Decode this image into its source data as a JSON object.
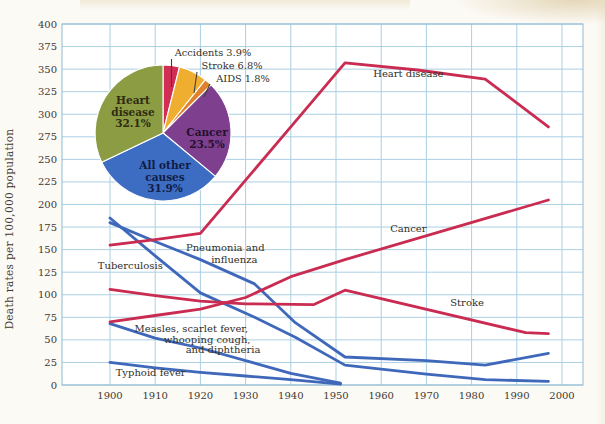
{
  "figure": {
    "page_bg": "#fcfaf5",
    "plot_bg": "#ffffff",
    "grid_color": "#abcfe3",
    "border_color": "#8fb9d3",
    "tick_text_color": "#3e3933",
    "annotation_text_color": "#322e28",
    "red": "#ca2b51",
    "blue": "#3f68ba",
    "leader_color": "#443f38"
  },
  "chart_data": [
    {
      "type": "line",
      "title": "",
      "xlabel": "",
      "ylabel": "Death rates per 100,000 population",
      "xlim": [
        1900,
        2000
      ],
      "ylim": [
        0,
        400
      ],
      "grid": true,
      "x_ticks": [
        1900,
        1910,
        1920,
        1930,
        1940,
        1950,
        1960,
        1970,
        1980,
        1990,
        2000
      ],
      "y_ticks": [
        0,
        25,
        50,
        75,
        100,
        125,
        150,
        175,
        200,
        225,
        250,
        275,
        300,
        325,
        350,
        375,
        400
      ],
      "series": [
        {
          "name": "Tuberculosis",
          "color": "blue",
          "points": [
            [
              1900,
              185
            ],
            [
              1910,
              143
            ],
            [
              1920,
              102
            ],
            [
              1932,
              75
            ],
            [
              1941,
              53
            ],
            [
              1952,
              22
            ],
            [
              1970,
              12
            ],
            [
              1983,
              6
            ],
            [
              1997,
              4
            ]
          ]
        },
        {
          "name": "Pneumonia and influenza",
          "color": "blue",
          "points": [
            [
              1900,
              180
            ],
            [
              1910,
              159
            ],
            [
              1920,
              139
            ],
            [
              1932,
              112
            ],
            [
              1941,
              69
            ],
            [
              1952,
              31
            ],
            [
              1970,
              27
            ],
            [
              1983,
              22
            ],
            [
              1997,
              35
            ]
          ]
        },
        {
          "name": "Measles, scarlet fever, whooping cough, and diphtheria",
          "color": "blue",
          "points": [
            [
              1900,
              68
            ],
            [
              1910,
              52
            ],
            [
              1920,
              41
            ],
            [
              1930,
              27
            ],
            [
              1940,
              13
            ],
            [
              1951,
              2
            ]
          ]
        },
        {
          "name": "Typhoid fever",
          "color": "blue",
          "points": [
            [
              1900,
              25
            ],
            [
              1910,
              19
            ],
            [
              1920,
              14
            ],
            [
              1930,
              10
            ],
            [
              1940,
              6
            ],
            [
              1951,
              1
            ]
          ]
        },
        {
          "name": "Heart disease",
          "color": "red",
          "points": [
            [
              1900,
              155
            ],
            [
              1910,
              161
            ],
            [
              1920,
              168
            ],
            [
              1930,
              227
            ],
            [
              1940,
              286
            ],
            [
              1952,
              357
            ],
            [
              1968,
              349
            ],
            [
              1983,
              339
            ],
            [
              1997,
              286
            ]
          ]
        },
        {
          "name": "Cancer",
          "color": "red",
          "points": [
            [
              1900,
              70
            ],
            [
              1910,
              77
            ],
            [
              1920,
              84
            ],
            [
              1930,
              97
            ],
            [
              1940,
              120
            ],
            [
              1952,
              139
            ],
            [
              1997,
              205
            ]
          ]
        },
        {
          "name": "Stroke",
          "color": "red",
          "points": [
            [
              1900,
              106
            ],
            [
              1910,
              99
            ],
            [
              1920,
              93
            ],
            [
              1930,
              90
            ],
            [
              1945,
              89
            ],
            [
              1952,
              105
            ],
            [
              1992,
              58
            ],
            [
              1997,
              57
            ]
          ]
        }
      ],
      "annotations": [
        {
          "text": "Heart disease",
          "x": 1966,
          "y": 341
        },
        {
          "text": "Cancer",
          "x": 1966,
          "y": 169
        },
        {
          "text": "Stroke",
          "x": 1979,
          "y": 88
        },
        {
          "text": "Tuberculosis",
          "x": 1904.5,
          "y": 129
        },
        {
          "text": "Pneumonia and",
          "x": 1925.5,
          "y": 148
        },
        {
          "text": "influenza",
          "x": 1927.5,
          "y": 135
        },
        {
          "text": "Measles, scarlet fever,",
          "x": 1918,
          "y": 59
        },
        {
          "text": "whooping cough,",
          "x": 1921.5,
          "y": 47
        },
        {
          "text": "and diphtheria",
          "x": 1925,
          "y": 35
        },
        {
          "text": "Typhoid fever",
          "x": 1909,
          "y": 10
        }
      ]
    },
    {
      "type": "pie",
      "title": "",
      "clockwise": true,
      "start_angle_deg": 0,
      "slices": [
        {
          "label": "Accidents",
          "value": 3.9,
          "color": "#d22e55"
        },
        {
          "label": "Stroke",
          "value": 6.8,
          "color": "#efae2f"
        },
        {
          "label": "AIDS",
          "value": 1.8,
          "color": "#e0812c"
        },
        {
          "label": "Cancer",
          "value": 23.5,
          "color": "#7d3f8e"
        },
        {
          "label": "All other causes",
          "value": 31.9,
          "color": "#3d6cc3"
        },
        {
          "label": "Heart disease",
          "value": 32.1,
          "color": "#8c9c42"
        }
      ],
      "inner_labels": [
        {
          "lines": [
            "Heart",
            "disease",
            "32.1%"
          ],
          "x": 133,
          "y": 104,
          "color": "#2f2a12"
        },
        {
          "lines": [
            "Cancer",
            "23.5%"
          ],
          "x": 207,
          "y": 136,
          "color": "#26102e"
        },
        {
          "lines": [
            "All other",
            "causes",
            "31.9%"
          ],
          "x": 165,
          "y": 169,
          "color": "#111c44"
        }
      ],
      "callouts": [
        {
          "text": "Accidents 3.9%",
          "x": 213,
          "y": 56,
          "leader": [
            [
              171.5,
              59
            ],
            [
              171.5,
              87
            ]
          ]
        },
        {
          "text": "Stroke 6.8%",
          "x": 232,
          "y": 69,
          "leader": [
            [
              197,
              72
            ],
            [
              194,
              93
            ]
          ]
        },
        {
          "text": "AIDS 1.8%",
          "x": 243,
          "y": 82,
          "leader": [
            [
              210,
              84
            ],
            [
              204,
              97
            ]
          ]
        }
      ]
    }
  ],
  "layout": {
    "svg_w": 605,
    "svg_h": 424,
    "plot": {
      "left": 62,
      "top": 24,
      "right": 583,
      "bottom": 385
    },
    "x_px": {
      "x1900": 110,
      "per_year": 4.52
    },
    "y_px": {
      "y0": 385,
      "per_unit": 0.9025
    },
    "pie": {
      "cx": 163,
      "cy": 133,
      "r": 68
    },
    "ylabel_pos": {
      "x": 13,
      "y": 229
    },
    "fonts": {
      "tick": 10,
      "annotation": 10,
      "pie_inner": 10.5,
      "callout": 9.8,
      "ylabel": 10.5
    }
  }
}
